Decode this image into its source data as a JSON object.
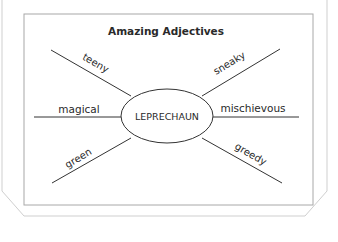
{
  "worksheet": {
    "title": "Amazing Adjectives",
    "center_word": "LEPRECHAUN",
    "adjectives": {
      "upper_left": "teeny",
      "upper_right": "sneaky",
      "left": "magical",
      "right": "mischievous",
      "lower_left": "green",
      "lower_right": "greedy"
    }
  }
}
